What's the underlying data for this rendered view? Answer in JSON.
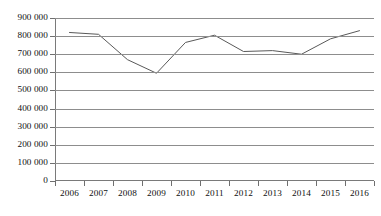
{
  "chart_data": {
    "type": "line",
    "title": "",
    "subtitle": "",
    "xlabel": "",
    "ylabel": "",
    "categories": [
      "2006",
      "2007",
      "2008",
      "2009",
      "2010",
      "2011",
      "2012",
      "2013",
      "2014",
      "2015",
      "2016"
    ],
    "series": [
      {
        "name": "",
        "values": [
          820000,
          810000,
          670000,
          595000,
          765000,
          805000,
          715000,
          720000,
          700000,
          785000,
          830000
        ],
        "color": "#595959"
      }
    ],
    "ylim": [
      0,
      900000
    ],
    "ytick_step": 100000,
    "ytick_labels": [
      "900 000",
      "800 000",
      "700 000",
      "600 000",
      "500 000",
      "400 000",
      "300 000",
      "200 000",
      "100 000",
      "0"
    ],
    "ytick_values": [
      900000,
      800000,
      700000,
      600000,
      500000,
      400000,
      300000,
      200000,
      100000,
      0
    ],
    "grid": true,
    "grid_axis": "y",
    "legend": false,
    "legend_position": "none",
    "gridline_color": "#8d8d8d",
    "axis_color": "#7a7a7a",
    "background": "#ffffff",
    "annotations": []
  }
}
